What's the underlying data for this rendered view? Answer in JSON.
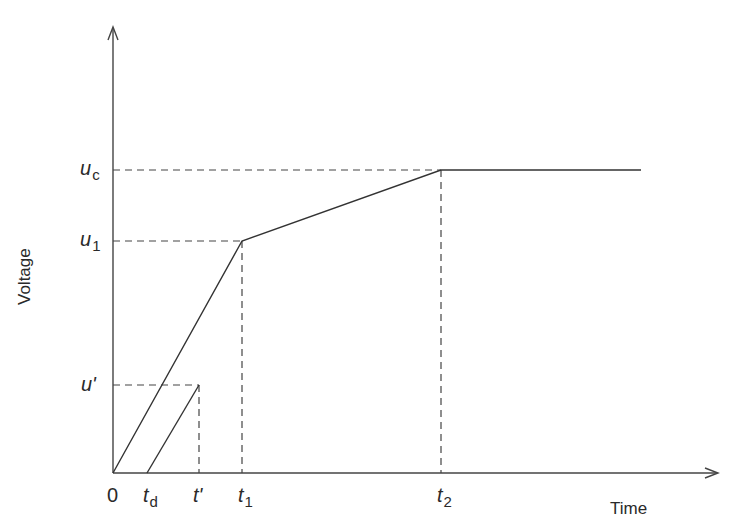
{
  "diagram": {
    "type": "voltage-time ramp diagram",
    "axes": {
      "x_title": "Time",
      "y_title": "Voltage"
    },
    "y_ticks": [
      {
        "id": "uc",
        "base": "u",
        "sub": "c"
      },
      {
        "id": "u1",
        "base": "u",
        "sub": "1"
      },
      {
        "id": "uprime",
        "base": "u'",
        "sub": ""
      }
    ],
    "x_ticks": [
      {
        "id": "origin",
        "base": "0",
        "sub": ""
      },
      {
        "id": "td",
        "base": "t",
        "sub": "d"
      },
      {
        "id": "tprime",
        "base": "t'",
        "sub": ""
      },
      {
        "id": "t1",
        "base": "t",
        "sub": "1"
      },
      {
        "id": "t2",
        "base": "t",
        "sub": "2"
      }
    ],
    "curves": [
      {
        "name": "main-voltage-curve",
        "points": [
          [
            "0",
            "0"
          ],
          [
            "t1",
            "u1"
          ],
          [
            "t2",
            "uc"
          ],
          [
            "end",
            "uc"
          ]
        ]
      },
      {
        "name": "delayed-ramp",
        "points": [
          [
            "td",
            "0"
          ],
          [
            "t'",
            "u'"
          ]
        ]
      }
    ],
    "colors": {
      "line": "#333333",
      "background": "#ffffff"
    }
  }
}
